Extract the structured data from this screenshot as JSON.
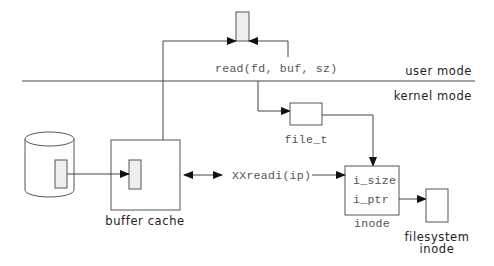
{
  "diagram": {
    "labels": {
      "syscall": "read(fd, buf, sz)",
      "user_mode": "user mode",
      "kernel_mode": "kernel mode",
      "file_t": "file_t",
      "xxreadi": "XXreadi(ip)",
      "buffer_cache": "buffer cache",
      "inode": "inode",
      "i_size": "i_size",
      "i_ptr": "i_ptr",
      "filesystem_inode_line1": "filesystem",
      "filesystem_inode_line2": "inode"
    },
    "nodes": [
      {
        "id": "user-buffer",
        "kind": "buffer"
      },
      {
        "id": "file_t",
        "kind": "box"
      },
      {
        "id": "inode",
        "kind": "box",
        "fields": [
          "i_size",
          "i_ptr"
        ]
      },
      {
        "id": "filesystem-inode",
        "kind": "box"
      },
      {
        "id": "buffer-cache",
        "kind": "box"
      },
      {
        "id": "cache-block",
        "kind": "buffer"
      },
      {
        "id": "disk",
        "kind": "cylinder"
      },
      {
        "id": "disk-block",
        "kind": "buffer"
      }
    ],
    "edges": [
      {
        "from": "disk-block",
        "to": "cache-block"
      },
      {
        "from": "cache-block",
        "to": "user-buffer"
      },
      {
        "from": "syscall",
        "to": "user-buffer"
      },
      {
        "from": "syscall",
        "to": "file_t"
      },
      {
        "from": "file_t",
        "to": "inode"
      },
      {
        "from": "xxreadi",
        "to": "inode"
      },
      {
        "from": "xxreadi",
        "to": "buffer-cache",
        "bidirectional": true
      },
      {
        "from": "inode.i_ptr",
        "to": "filesystem-inode"
      }
    ],
    "colors": {
      "stroke": "#444444",
      "buffer_fill": "#efefef",
      "mono_text": "#555555",
      "sans_text": "#222222"
    }
  }
}
